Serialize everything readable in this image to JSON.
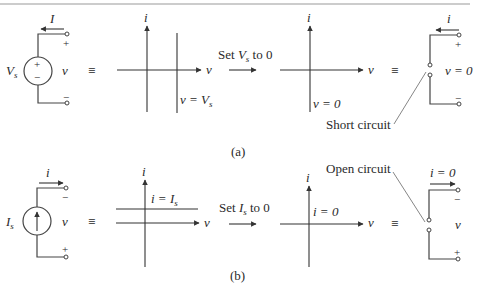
{
  "figure": {
    "top_rule_color": "#9a9a9a",
    "part_a": {
      "caption": "(a)",
      "source": {
        "name": "V",
        "sub": "s",
        "current_label": "I",
        "plus": "+",
        "minus": "−",
        "terminal_plus": "+",
        "terminal_minus": "−",
        "voltage_label": "v"
      },
      "equiv": "≡",
      "graph1": {
        "i_label": "i",
        "v_label": "v",
        "line_label_lhs": "v = V",
        "line_label_sub": "s"
      },
      "transform": {
        "prefix": "Set ",
        "var": "V",
        "sub": "s",
        "suffix": " to 0"
      },
      "graph2": {
        "i_label": "i",
        "v_label": "v",
        "line_label": "v = 0"
      },
      "equiv2": "≡",
      "result": {
        "current_label": "i",
        "terminal_plus": "+",
        "terminal_minus": "−",
        "voltage_label": "v = 0",
        "annotation": "Short circuit"
      }
    },
    "part_b": {
      "caption": "(b)",
      "source": {
        "name": "I",
        "sub": "s",
        "current_label": "i",
        "terminal_top": "−",
        "terminal_bottom": "+",
        "voltage_label": "v"
      },
      "equiv": "≡",
      "graph1": {
        "i_label": "i",
        "v_label": "v",
        "line_label_lhs": "i = I",
        "line_label_sub": "s"
      },
      "transform": {
        "prefix": "Set ",
        "var": "I",
        "sub": "s",
        "suffix": " to 0"
      },
      "graph2": {
        "i_label": "i",
        "v_label": "v",
        "line_label": "i = 0"
      },
      "equiv2": "≡",
      "result": {
        "current_label": "i = 0",
        "terminal_top": "−",
        "terminal_bottom": "+",
        "voltage_label": "v",
        "annotation": "Open circuit"
      }
    }
  }
}
